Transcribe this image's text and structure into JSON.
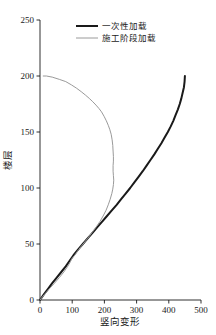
{
  "chart_data": {
    "type": "line",
    "title": "",
    "xlabel": "竖向变形",
    "ylabel": "楼层",
    "xlim": [
      0,
      500
    ],
    "ylim": [
      0,
      250
    ],
    "xticks": [
      0,
      100,
      200,
      300,
      400,
      500
    ],
    "yticks": [
      0,
      50,
      100,
      150,
      200,
      250
    ],
    "xtick_labels": [
      "0",
      "100",
      "200",
      "300",
      "400",
      "500"
    ],
    "ytick_labels": [
      "0",
      "50",
      "100",
      "150",
      "200",
      "250"
    ],
    "grid": false,
    "legend_position": "top-center",
    "series": [
      {
        "name": "一次性加载",
        "color": "#1a1a1a",
        "width": 2.0,
        "points": [
          [
            0,
            0
          ],
          [
            12,
            5
          ],
          [
            25,
            10
          ],
          [
            38,
            15
          ],
          [
            52,
            20
          ],
          [
            66,
            25
          ],
          [
            80,
            30
          ],
          [
            92,
            35
          ],
          [
            104,
            40
          ],
          [
            118,
            45
          ],
          [
            133,
            50
          ],
          [
            148,
            55
          ],
          [
            163,
            60
          ],
          [
            178,
            65
          ],
          [
            193,
            70
          ],
          [
            208,
            75
          ],
          [
            223,
            80
          ],
          [
            238,
            85
          ],
          [
            252,
            90
          ],
          [
            266,
            95
          ],
          [
            280,
            100
          ],
          [
            293,
            105
          ],
          [
            306,
            110
          ],
          [
            319,
            115
          ],
          [
            331,
            120
          ],
          [
            343,
            125
          ],
          [
            355,
            130
          ],
          [
            366,
            135
          ],
          [
            377,
            140
          ],
          [
            387,
            145
          ],
          [
            397,
            150
          ],
          [
            406,
            155
          ],
          [
            414,
            160
          ],
          [
            421,
            165
          ],
          [
            428,
            170
          ],
          [
            434,
            175
          ],
          [
            439,
            180
          ],
          [
            443,
            185
          ],
          [
            447,
            190
          ],
          [
            449,
            195
          ],
          [
            450,
            200
          ]
        ]
      },
      {
        "name": "施工阶段加载",
        "color": "#9a9a9a",
        "width": 1.0,
        "points": [
          [
            0,
            0
          ],
          [
            14,
            5
          ],
          [
            29,
            10
          ],
          [
            45,
            15
          ],
          [
            60,
            20
          ],
          [
            74,
            25
          ],
          [
            86,
            30
          ],
          [
            94,
            34
          ],
          [
            99,
            37
          ],
          [
            108,
            40
          ],
          [
            120,
            45
          ],
          [
            134,
            50
          ],
          [
            148,
            55
          ],
          [
            161,
            60
          ],
          [
            174,
            65
          ],
          [
            186,
            70
          ],
          [
            196,
            75
          ],
          [
            205,
            80
          ],
          [
            212,
            85
          ],
          [
            218,
            90
          ],
          [
            223,
            95
          ],
          [
            226,
            99
          ],
          [
            228,
            103
          ],
          [
            229,
            107
          ],
          [
            228,
            111
          ],
          [
            227,
            115
          ],
          [
            227,
            120
          ],
          [
            228,
            124
          ],
          [
            228,
            128
          ],
          [
            227,
            133
          ],
          [
            226,
            138
          ],
          [
            224,
            143
          ],
          [
            221,
            148
          ],
          [
            217,
            152
          ],
          [
            212,
            156
          ],
          [
            206,
            160
          ],
          [
            199,
            164
          ],
          [
            191,
            168
          ],
          [
            183,
            171
          ],
          [
            174,
            174
          ],
          [
            164,
            177
          ],
          [
            153,
            180
          ],
          [
            141,
            183
          ],
          [
            128,
            186
          ],
          [
            114,
            189
          ],
          [
            98,
            192
          ],
          [
            80,
            195
          ],
          [
            60,
            197
          ],
          [
            38,
            199
          ],
          [
            20,
            200
          ],
          [
            10,
            200
          ]
        ]
      }
    ]
  },
  "legend": {
    "entries": [
      {
        "label": "一次性加载"
      },
      {
        "label": "施工阶段加载"
      }
    ]
  }
}
